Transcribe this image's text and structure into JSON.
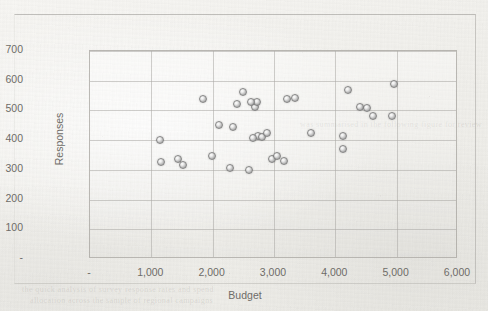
{
  "chart_data": {
    "type": "scatter",
    "title": "",
    "xlabel": "Budget",
    "ylabel": "Responses",
    "xlim": [
      0,
      6000
    ],
    "ylim": [
      0,
      700
    ],
    "grid": true,
    "legend": "none",
    "xticklabels": [
      "-",
      "1,000",
      "2,000",
      "3,000",
      "4,000",
      "5,000",
      "6,000"
    ],
    "xtickvalues": [
      0,
      1000,
      2000,
      3000,
      4000,
      5000,
      6000
    ],
    "yticklabels": [
      "-",
      "100",
      "200",
      "300",
      "400",
      "500",
      "600",
      "700"
    ],
    "ytickvalues": [
      0,
      100,
      200,
      300,
      400,
      500,
      600,
      700
    ],
    "marker": {
      "shape": "circle",
      "fill": "#d0d0d0",
      "edge": "#7c7c7c",
      "size": 8
    },
    "points": [
      {
        "x": 1140,
        "y": 402
      },
      {
        "x": 1150,
        "y": 325
      },
      {
        "x": 1430,
        "y": 335
      },
      {
        "x": 1510,
        "y": 315
      },
      {
        "x": 1840,
        "y": 537
      },
      {
        "x": 1990,
        "y": 345
      },
      {
        "x": 2100,
        "y": 450
      },
      {
        "x": 2290,
        "y": 305
      },
      {
        "x": 2330,
        "y": 445
      },
      {
        "x": 2400,
        "y": 520
      },
      {
        "x": 2490,
        "y": 562
      },
      {
        "x": 2590,
        "y": 300
      },
      {
        "x": 2690,
        "y": 512
      },
      {
        "x": 2720,
        "y": 530
      },
      {
        "x": 2740,
        "y": 415
      },
      {
        "x": 2800,
        "y": 410
      },
      {
        "x": 2880,
        "y": 425
      },
      {
        "x": 2960,
        "y": 335
      },
      {
        "x": 3050,
        "y": 345
      },
      {
        "x": 3220,
        "y": 537
      },
      {
        "x": 3350,
        "y": 542
      },
      {
        "x": 3600,
        "y": 425
      },
      {
        "x": 3160,
        "y": 330
      },
      {
        "x": 4200,
        "y": 570
      },
      {
        "x": 4120,
        "y": 415
      },
      {
        "x": 4130,
        "y": 370
      },
      {
        "x": 4410,
        "y": 512
      },
      {
        "x": 4510,
        "y": 508
      },
      {
        "x": 4610,
        "y": 480
      },
      {
        "x": 4960,
        "y": 588
      },
      {
        "x": 4920,
        "y": 482
      },
      {
        "x": 2650,
        "y": 408
      },
      {
        "x": 2620,
        "y": 530
      }
    ]
  },
  "page": {
    "ghost_lines": [
      "the quick analysis of survey response rates and spend",
      "allocation across the sample of regional campaigns",
      "was summarised in the following figure for review"
    ]
  }
}
